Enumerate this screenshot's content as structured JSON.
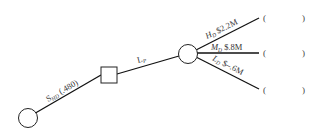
{
  "diagram": {
    "type": "decision-tree",
    "nodes": [
      {
        "id": "root",
        "shape": "circle",
        "role": "chance-node"
      },
      {
        "id": "decision",
        "shape": "square",
        "role": "decision-node"
      },
      {
        "id": "outcome",
        "shape": "circle",
        "role": "chance-node"
      }
    ],
    "branches": {
      "s": {
        "main": "S",
        "sub": "HD",
        "suffix": " (.480)"
      },
      "l": {
        "main": "L",
        "sub": "P"
      },
      "h": {
        "main": "H",
        "sub": "D",
        "value": " $2.2M"
      },
      "m": {
        "main": "M",
        "sub": "D",
        "value": " $.8M"
      },
      "lo": {
        "main": "L",
        "sub": "D",
        "value": " $–.6M"
      }
    },
    "blanks": [
      {
        "open": "(",
        "close": ")"
      },
      {
        "open": "(",
        "close": ")"
      },
      {
        "open": "(",
        "close": ")"
      }
    ],
    "colors": {
      "line": "#111111",
      "text": "#333333",
      "background": "#ffffff"
    }
  }
}
